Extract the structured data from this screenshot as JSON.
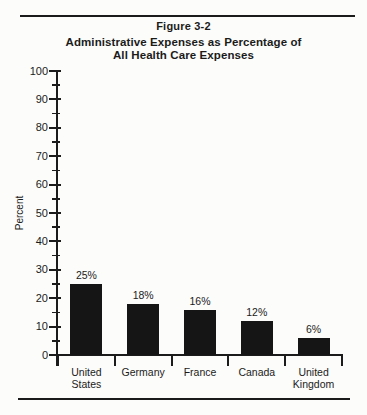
{
  "figure": {
    "label": "Figure 3-2",
    "title_line1": "Administrative Expenses as Percentage of",
    "title_line2": "All Health Care Expenses"
  },
  "chart_data": {
    "type": "bar",
    "title": "Administrative Expenses as Percentage of All Health Care Expenses",
    "figure_label": "Figure 3-2",
    "categories": [
      "United States",
      "Germany",
      "France",
      "Canada",
      "United Kingdom"
    ],
    "values": [
      25,
      18,
      16,
      12,
      6
    ],
    "value_labels": [
      "25%",
      "18%",
      "16%",
      "12%",
      "6%"
    ],
    "xlabel": "",
    "ylabel": "Percent",
    "ylim": [
      0,
      100
    ],
    "ytick_interval": 10,
    "yminor_tick_interval": 5,
    "grid": false,
    "legend": false,
    "bar_color": "#151515",
    "axis_color": "#1b1b1b",
    "text_color": "#1b1b1b",
    "background_color": "#fcfcfa"
  }
}
